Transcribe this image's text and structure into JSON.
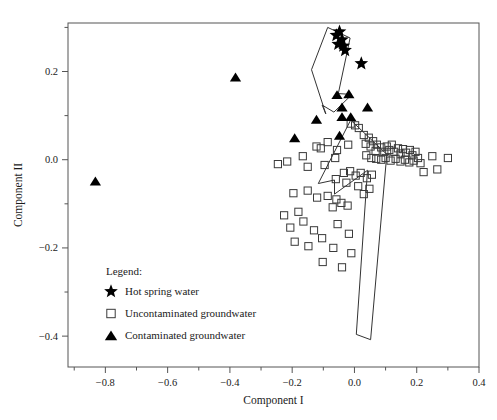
{
  "chart_data": {
    "type": "scatter",
    "title": "",
    "xlabel": "Component I",
    "ylabel": "Component II",
    "xlim": [
      -0.92,
      0.4
    ],
    "ylim": [
      -0.47,
      0.31
    ],
    "grid": false,
    "legend_position": "inside-lower-left",
    "xticks": [
      -0.8,
      -0.6,
      -0.4,
      -0.2,
      0.0,
      0.2,
      0.4
    ],
    "xticklabels": [
      "−0.8",
      "−0.6",
      "−0.4",
      "−0.2",
      "0.0",
      "0.2",
      "0.4"
    ],
    "xminorticks": [
      -0.9,
      -0.7,
      -0.5,
      -0.3,
      -0.1,
      0.1,
      0.3
    ],
    "yticks": [
      0.2,
      0.0,
      -0.2,
      -0.4
    ],
    "yticklabels": [
      "0.2",
      "0.0",
      "−0.2",
      "−0.4"
    ],
    "yminorticks": [
      0.3,
      0.1,
      -0.1,
      -0.3
    ],
    "series": [
      {
        "name": "Hot spring water",
        "marker": "star",
        "marker_filled": true,
        "points": [
          [
            -0.058,
            0.282
          ],
          [
            -0.048,
            0.29
          ],
          [
            -0.04,
            0.272
          ],
          [
            -0.052,
            0.262
          ],
          [
            -0.036,
            0.258
          ],
          [
            -0.03,
            0.248
          ],
          [
            0.022,
            0.218
          ]
        ]
      },
      {
        "name": "Uncontaminated groundwater",
        "marker": "square",
        "marker_filled": false,
        "points": [
          [
            -0.012,
            0.082
          ],
          [
            0.002,
            0.078
          ],
          [
            0.014,
            0.072
          ],
          [
            -0.086,
            0.04
          ],
          [
            -0.122,
            0.03
          ],
          [
            -0.108,
            0.026
          ],
          [
            -0.056,
            0.022
          ],
          [
            -0.02,
            0.034
          ],
          [
            -0.166,
            0.008
          ],
          [
            -0.216,
            -0.004
          ],
          [
            -0.246,
            -0.01
          ],
          [
            -0.15,
            -0.016
          ],
          [
            -0.096,
            -0.012
          ],
          [
            -0.062,
            0.004
          ],
          [
            0.03,
            0.056
          ],
          [
            0.046,
            0.05
          ],
          [
            0.036,
            0.036
          ],
          [
            0.052,
            0.03
          ],
          [
            0.06,
            0.042
          ],
          [
            0.072,
            0.034
          ],
          [
            0.068,
            0.02
          ],
          [
            0.086,
            0.028
          ],
          [
            0.096,
            0.018
          ],
          [
            0.104,
            0.03
          ],
          [
            0.112,
            0.022
          ],
          [
            0.12,
            0.034
          ],
          [
            0.128,
            0.018
          ],
          [
            0.14,
            0.026
          ],
          [
            0.148,
            0.014
          ],
          [
            0.156,
            0.024
          ],
          [
            0.166,
            0.016
          ],
          [
            0.178,
            0.022
          ],
          [
            0.186,
            0.01
          ],
          [
            0.196,
            0.018
          ],
          [
            0.038,
            0.01
          ],
          [
            0.054,
            0.004
          ],
          [
            0.07,
            0.002
          ],
          [
            0.086,
            0.0
          ],
          [
            0.1,
            0.004
          ],
          [
            0.116,
            -0.002
          ],
          [
            0.132,
            0.002
          ],
          [
            0.148,
            -0.004
          ],
          [
            0.162,
            0.0
          ],
          [
            0.176,
            -0.006
          ],
          [
            0.19,
            -0.002
          ],
          [
            0.204,
            0.004
          ],
          [
            0.212,
            -0.008
          ],
          [
            0.25,
            0.008
          ],
          [
            0.3,
            0.004
          ],
          [
            0.222,
            -0.028
          ],
          [
            0.266,
            -0.022
          ],
          [
            -0.034,
            -0.03
          ],
          [
            -0.014,
            -0.026
          ],
          [
            0.004,
            -0.036
          ],
          [
            0.02,
            -0.03
          ],
          [
            0.04,
            -0.042
          ],
          [
            0.056,
            -0.034
          ],
          [
            -0.06,
            -0.044
          ],
          [
            -0.026,
            -0.052
          ],
          [
            0.012,
            -0.06
          ],
          [
            0.048,
            -0.066
          ],
          [
            0.03,
            -0.078
          ],
          [
            -0.15,
            -0.07
          ],
          [
            -0.196,
            -0.076
          ],
          [
            -0.12,
            -0.086
          ],
          [
            -0.086,
            -0.082
          ],
          [
            -0.058,
            -0.09
          ],
          [
            -0.042,
            -0.098
          ],
          [
            -0.022,
            -0.104
          ],
          [
            -0.07,
            -0.108
          ],
          [
            -0.18,
            -0.118
          ],
          [
            -0.226,
            -0.126
          ],
          [
            -0.164,
            -0.14
          ],
          [
            -0.206,
            -0.154
          ],
          [
            -0.13,
            -0.16
          ],
          [
            -0.054,
            -0.146
          ],
          [
            -0.104,
            -0.178
          ],
          [
            -0.192,
            -0.186
          ],
          [
            -0.148,
            -0.196
          ],
          [
            -0.068,
            -0.2
          ],
          [
            -0.018,
            -0.168
          ],
          [
            -0.01,
            -0.212
          ],
          [
            -0.102,
            -0.232
          ],
          [
            -0.04,
            -0.244
          ]
        ]
      },
      {
        "name": "Contaminated groundwater",
        "marker": "triangle",
        "marker_filled": true,
        "points": [
          [
            -0.382,
            0.186
          ],
          [
            -0.832,
            -0.05
          ],
          [
            -0.056,
            0.146
          ],
          [
            -0.018,
            0.148
          ],
          [
            -0.04,
            0.118
          ],
          [
            0.042,
            0.118
          ],
          [
            -0.04,
            0.096
          ],
          [
            -0.012,
            0.096
          ],
          [
            -0.122,
            0.09
          ],
          [
            -0.192,
            0.048
          ],
          [
            -0.048,
            0.054
          ]
        ]
      }
    ],
    "hulls": [
      {
        "name": "upper-arrow-outline",
        "points": [
          [
            -0.086,
            0.3
          ],
          [
            -0.014,
            0.276
          ],
          [
            -0.052,
            0.15
          ],
          [
            -0.008,
            0.148
          ],
          [
            -0.066,
            0.108
          ],
          [
            -0.104,
            0.124
          ],
          [
            -0.092,
            0.104
          ],
          [
            -0.138,
            0.204
          ]
        ]
      },
      {
        "name": "lower-arrow-outline",
        "points": [
          [
            -0.012,
            0.09
          ],
          [
            0.104,
            0.012
          ],
          [
            0.052,
            -0.408
          ],
          [
            0.006,
            -0.396
          ],
          [
            0.042,
            -0.024
          ],
          [
            -0.064,
            -0.078
          ],
          [
            -0.064,
            -0.046
          ],
          [
            -0.116,
            -0.054
          ]
        ]
      }
    ]
  },
  "legend": {
    "title": "Legend:",
    "entries": [
      {
        "label": "Hot spring water",
        "marker": "star-marker"
      },
      {
        "label": "Uncontaminated groundwater",
        "marker": "square-marker"
      },
      {
        "label": "Contaminated groundwater",
        "marker": "triangle-marker"
      }
    ]
  }
}
